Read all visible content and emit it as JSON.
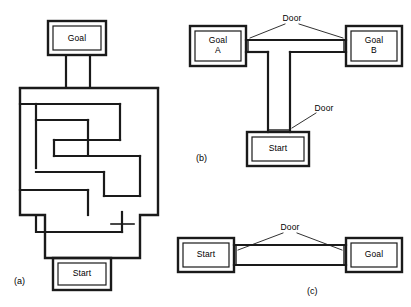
{
  "figure": {
    "panels": [
      {
        "id": "a",
        "id_label": "(a)",
        "type": "maze",
        "labels": [
          {
            "name": "goal-label",
            "text": "Goal"
          },
          {
            "name": "start-label",
            "text": "Start"
          }
        ]
      },
      {
        "id": "b",
        "id_label": "(b)",
        "type": "t-maze",
        "labels": [
          {
            "name": "goal-a-label",
            "text": "Goal\nA"
          },
          {
            "name": "goal-b-label",
            "text": "Goal\nB"
          },
          {
            "name": "start-label",
            "text": "Start"
          },
          {
            "name": "door-top-label",
            "text": "Door"
          },
          {
            "name": "door-mid-label",
            "text": "Door"
          }
        ]
      },
      {
        "id": "c",
        "id_label": "(c)",
        "type": "straight-alley",
        "labels": [
          {
            "name": "start-label",
            "text": "Start"
          },
          {
            "name": "goal-label",
            "text": "Goal"
          },
          {
            "name": "door-label",
            "text": "Door"
          }
        ]
      }
    ],
    "colors": {
      "ink": "#1a1a1a",
      "paper": "#ffffff",
      "wall_fill": "#3a3a3a"
    }
  }
}
